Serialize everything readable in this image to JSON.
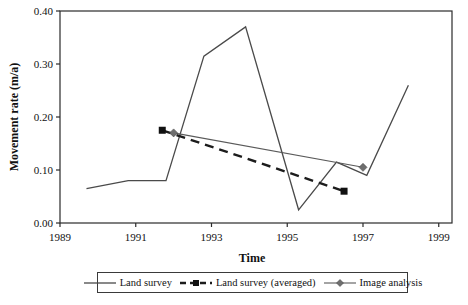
{
  "chart_data": {
    "type": "line",
    "title": "",
    "xlabel": "Time",
    "ylabel": "Movement rate (m/a)",
    "xlim": [
      1989,
      1999.35
    ],
    "ylim": [
      0,
      0.4
    ],
    "x_ticks": [
      1989,
      1991,
      1993,
      1995,
      1997,
      1999
    ],
    "y_tick_labels": [
      "0.00",
      "0.10",
      "0.20",
      "0.30",
      "0.40"
    ],
    "grid": "off",
    "legend_position": "bottom-center",
    "frame_color": "#2b2b2b",
    "series": [
      {
        "name": "Land survey",
        "line_style": "solid",
        "marker": "none",
        "color": "#4a4a4a",
        "line_width": 1.3,
        "x": [
          1989.7,
          1990.8,
          1991.8,
          1992.8,
          1993.9,
          1995.3,
          1996.3,
          1997.1,
          1998.2
        ],
        "y": [
          0.065,
          0.08,
          0.08,
          0.315,
          0.37,
          0.025,
          0.115,
          0.09,
          0.26
        ]
      },
      {
        "name": "Land survey (averaged)",
        "line_style": "dashed",
        "marker": "square",
        "color": "#1c1c1c",
        "marker_color": "#111111",
        "line_width": 2.4,
        "x": [
          1991.7,
          1996.5
        ],
        "y": [
          0.175,
          0.06
        ]
      },
      {
        "name": "Image analysis",
        "line_style": "solid",
        "marker": "diamond",
        "color": "#5a5a5a",
        "marker_color": "#6e6e6e",
        "line_width": 1.1,
        "x": [
          1992.0,
          1997.0
        ],
        "y": [
          0.17,
          0.105
        ]
      }
    ]
  }
}
